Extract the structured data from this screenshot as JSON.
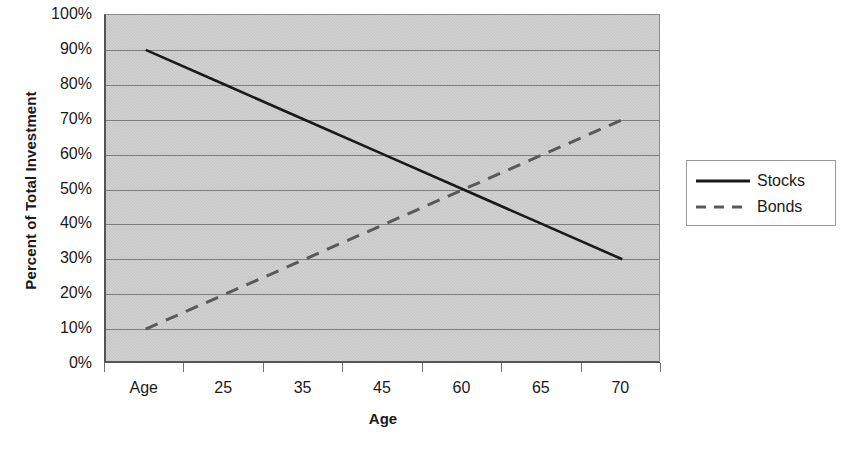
{
  "chart_data": {
    "type": "line",
    "title": "",
    "xlabel": "Age",
    "ylabel": "Percent of Total Investment",
    "categories": [
      "Age",
      "25",
      "35",
      "45",
      "60",
      "65",
      "70"
    ],
    "series": [
      {
        "name": "Stocks",
        "values": [
          90,
          80,
          70,
          60,
          50,
          40,
          30
        ],
        "style": "solid",
        "color": "#1a1a1a"
      },
      {
        "name": "Bonds",
        "values": [
          10,
          20,
          30,
          40,
          50,
          60,
          70
        ],
        "style": "dashed",
        "color": "#5a5a5a"
      }
    ],
    "ylim": [
      0,
      100
    ],
    "ytick_labels": [
      "100%",
      "90%",
      "80%",
      "70%",
      "60%",
      "50%",
      "40%",
      "30%",
      "20%",
      "10%",
      "0%"
    ],
    "ytick_values": [
      100,
      90,
      80,
      70,
      60,
      50,
      40,
      30,
      20,
      10,
      0
    ],
    "y_unit": "%",
    "grid": "horizontal",
    "legend_position": "right",
    "plot_background": "#c4c4c4",
    "gridline_color": "#7d7d7d",
    "axis_color": "#555555"
  },
  "legend": {
    "entries": [
      {
        "label": "Stocks"
      },
      {
        "label": "Bonds"
      }
    ]
  }
}
